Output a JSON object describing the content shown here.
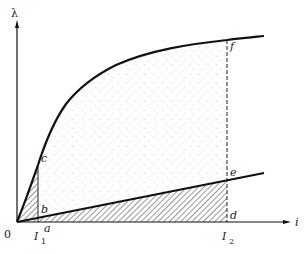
{
  "diagram": {
    "type": "magnetization-curve-energy-diagram",
    "axes": {
      "y_label": "λ",
      "x_label": "i",
      "origin_label": "0"
    },
    "ticks": {
      "I1": {
        "main": "I",
        "sub": "1"
      },
      "I2": {
        "main": "I",
        "sub": "2"
      }
    },
    "points": {
      "a": "a",
      "b": "b",
      "c": "c",
      "d": "d",
      "e": "e",
      "f": "f"
    },
    "curves": [
      {
        "name": "magnetization-curve",
        "description": "concave upper curve from origin through c to f"
      },
      {
        "name": "linear-line",
        "description": "straight line from origin through b to e"
      }
    ],
    "regions": [
      {
        "name": "triangle-0bc",
        "fill": "hatched"
      },
      {
        "name": "triangle-0de",
        "fill": "hatched"
      },
      {
        "name": "region-bcfe",
        "fill": "stippled"
      }
    ],
    "colors": {
      "line": "#111111",
      "hatch": "#333333",
      "stipple": "#b0b0b0"
    }
  }
}
